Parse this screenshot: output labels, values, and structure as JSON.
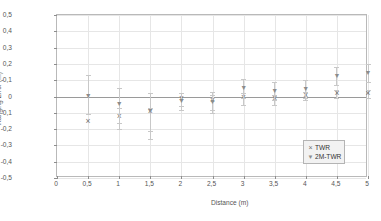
{
  "chart_data": {
    "type": "scatter",
    "title": "",
    "xlabel": "Distance (m)",
    "ylabel": "Ranging Error (m)",
    "xlim": [
      0,
      5
    ],
    "ylim": [
      -0.5,
      0.5
    ],
    "grid": true,
    "decimal_separator": ",",
    "legend_position": "bottom-right",
    "xticks": [
      0,
      0.5,
      1,
      1.5,
      2,
      2.5,
      3,
      3.5,
      4,
      4.5,
      5
    ],
    "xticklabels": [
      "0",
      "0,5",
      "1",
      "1,5",
      "2",
      "2,5",
      "3",
      "3,5",
      "4",
      "4,5",
      "5"
    ],
    "yticks": [
      0.5,
      0.4,
      0.3,
      0.2,
      0.1,
      0,
      -0.1,
      -0.2,
      -0.3,
      -0.4,
      -0.5
    ],
    "yticklabels": [
      "0,5",
      "0,4",
      "0,3",
      "0,2",
      "0,1",
      "0",
      "-0,1",
      "-0,2",
      "-0,3",
      "-0,4",
      "-0,5"
    ],
    "x": [
      0.5,
      1,
      1.5,
      2,
      2.5,
      3,
      3.5,
      4,
      4.5,
      5
    ],
    "series": [
      {
        "name": "TWR",
        "marker": "x",
        "color": "#6f6f6f",
        "values": [
          -0.15,
          -0.12,
          -0.09,
          -0.01,
          -0.02,
          0.0,
          -0.01,
          0.01,
          0.02,
          0.02
        ],
        "errors_up": [
          0.0,
          0.05,
          0.02,
          0.03,
          0.03,
          0.02,
          0.02,
          0.02,
          0.02,
          0.02
        ],
        "errors_down": [
          0.0,
          0.08,
          0.12,
          0.05,
          0.06,
          0.05,
          0.04,
          0.03,
          0.03,
          0.03
        ]
      },
      {
        "name": "2M-TWR",
        "marker": "triangle-down",
        "color": "#8c8c8c",
        "values": [
          0.01,
          -0.04,
          -0.08,
          -0.02,
          -0.03,
          0.06,
          0.04,
          0.05,
          0.13,
          0.15
        ],
        "errors_up": [
          0.12,
          0.09,
          0.1,
          0.04,
          0.06,
          0.05,
          0.05,
          0.05,
          0.05,
          0.05
        ],
        "errors_down": [
          0.12,
          0.12,
          0.18,
          0.06,
          0.07,
          0.07,
          0.06,
          0.06,
          0.06,
          0.06
        ]
      }
    ]
  },
  "legend": {
    "items": [
      {
        "symbol": "×",
        "label": "TWR"
      },
      {
        "symbol": "▼",
        "label": "2M-TWR"
      }
    ]
  }
}
